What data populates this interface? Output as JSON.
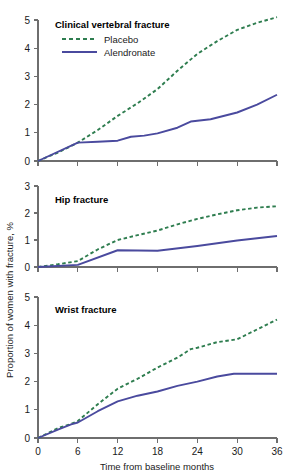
{
  "figure": {
    "y_axis_title": "Proportion of women with fracture, %",
    "x_axis_title": "Time from baseline months",
    "legend": {
      "placebo_label": "Placebo",
      "alendronate_label": "Alendronate",
      "placebo_color": "#2e7d4f",
      "alendronate_color": "#4a4a9e",
      "placebo_style": "dashed",
      "alendronate_style": "solid"
    }
  },
  "chart_data": [
    {
      "type": "line",
      "title": "Clinical vertebral fracture",
      "xlabel": "Time from baseline months",
      "ylabel": "Proportion of women with fracture, %",
      "x": [
        0,
        6,
        12,
        18,
        24,
        30,
        36
      ],
      "xlim": [
        0,
        36
      ],
      "ylim": [
        0,
        5
      ],
      "yticks": [
        0,
        1,
        2,
        3,
        4,
        5
      ],
      "xticks": [
        0,
        6,
        12,
        18,
        24,
        30,
        36
      ],
      "grid": false,
      "legend_position": "top-left",
      "series": [
        {
          "name": "Placebo",
          "color": "#2e7d4f",
          "style": "dashed",
          "values": [
            0.0,
            0.65,
            1.6,
            2.55,
            3.8,
            4.65,
            5.1
          ],
          "points": [
            {
              "x": 0,
              "y": 0.0
            },
            {
              "x": 3,
              "y": 0.3
            },
            {
              "x": 6,
              "y": 0.65
            },
            {
              "x": 9,
              "y": 1.1
            },
            {
              "x": 12,
              "y": 1.6
            },
            {
              "x": 15,
              "y": 2.05
            },
            {
              "x": 18,
              "y": 2.55
            },
            {
              "x": 21,
              "y": 3.2
            },
            {
              "x": 24,
              "y": 3.8
            },
            {
              "x": 27,
              "y": 4.25
            },
            {
              "x": 30,
              "y": 4.65
            },
            {
              "x": 33,
              "y": 4.9
            },
            {
              "x": 36,
              "y": 5.1
            }
          ]
        },
        {
          "name": "Alendronate",
          "color": "#4a4a9e",
          "style": "solid",
          "values": [
            0.0,
            0.65,
            0.72,
            0.98,
            1.4,
            1.72,
            2.35
          ],
          "points": [
            {
              "x": 0,
              "y": 0.0
            },
            {
              "x": 6,
              "y": 0.65
            },
            {
              "x": 9,
              "y": 0.68
            },
            {
              "x": 12,
              "y": 0.72
            },
            {
              "x": 14,
              "y": 0.86
            },
            {
              "x": 16,
              "y": 0.9
            },
            {
              "x": 18,
              "y": 0.98
            },
            {
              "x": 21,
              "y": 1.18
            },
            {
              "x": 23,
              "y": 1.4
            },
            {
              "x": 26,
              "y": 1.48
            },
            {
              "x": 30,
              "y": 1.72
            },
            {
              "x": 33,
              "y": 2.0
            },
            {
              "x": 36,
              "y": 2.35
            }
          ]
        }
      ]
    },
    {
      "type": "line",
      "title": "Hip fracture",
      "xlabel": "Time from baseline months",
      "ylabel": "Proportion of women with fracture, %",
      "x": [
        0,
        6,
        12,
        18,
        24,
        30,
        36
      ],
      "xlim": [
        0,
        36
      ],
      "ylim": [
        0,
        3
      ],
      "yticks": [
        0,
        1,
        2,
        3
      ],
      "xticks": [
        0,
        6,
        12,
        18,
        24,
        30,
        36
      ],
      "grid": false,
      "legend_position": "none",
      "series": [
        {
          "name": "Placebo",
          "color": "#2e7d4f",
          "style": "dashed",
          "values": [
            0.0,
            0.22,
            1.0,
            1.35,
            1.78,
            2.1,
            2.25
          ],
          "points": [
            {
              "x": 0,
              "y": 0.0
            },
            {
              "x": 3,
              "y": 0.1
            },
            {
              "x": 6,
              "y": 0.22
            },
            {
              "x": 9,
              "y": 0.65
            },
            {
              "x": 12,
              "y": 1.0
            },
            {
              "x": 15,
              "y": 1.18
            },
            {
              "x": 18,
              "y": 1.35
            },
            {
              "x": 21,
              "y": 1.58
            },
            {
              "x": 24,
              "y": 1.78
            },
            {
              "x": 27,
              "y": 1.95
            },
            {
              "x": 30,
              "y": 2.1
            },
            {
              "x": 33,
              "y": 2.2
            },
            {
              "x": 36,
              "y": 2.25
            }
          ]
        },
        {
          "name": "Alendronate",
          "color": "#4a4a9e",
          "style": "solid",
          "values": [
            0.0,
            0.08,
            0.62,
            0.6,
            0.78,
            0.98,
            1.15
          ],
          "points": [
            {
              "x": 0,
              "y": 0.0
            },
            {
              "x": 6,
              "y": 0.08
            },
            {
              "x": 12,
              "y": 0.62
            },
            {
              "x": 18,
              "y": 0.6
            },
            {
              "x": 24,
              "y": 0.78
            },
            {
              "x": 30,
              "y": 0.98
            },
            {
              "x": 36,
              "y": 1.15
            }
          ]
        }
      ]
    },
    {
      "type": "line",
      "title": "Wrist fracture",
      "xlabel": "Time from baseline months",
      "ylabel": "Proportion of women with fracture, %",
      "x": [
        0,
        6,
        12,
        18,
        24,
        30,
        36
      ],
      "xlim": [
        0,
        36
      ],
      "ylim": [
        0,
        5
      ],
      "yticks": [
        0,
        1,
        2,
        3,
        4,
        5
      ],
      "xticks": [
        0,
        6,
        12,
        18,
        24,
        30,
        36
      ],
      "grid": false,
      "legend_position": "none",
      "series": [
        {
          "name": "Placebo",
          "color": "#2e7d4f",
          "style": "dashed",
          "values": [
            0.0,
            0.6,
            1.75,
            2.5,
            3.2,
            3.5,
            4.2
          ],
          "points": [
            {
              "x": 0,
              "y": 0.0
            },
            {
              "x": 3,
              "y": 0.35
            },
            {
              "x": 5,
              "y": 0.5
            },
            {
              "x": 6,
              "y": 0.6
            },
            {
              "x": 9,
              "y": 1.2
            },
            {
              "x": 12,
              "y": 1.75
            },
            {
              "x": 15,
              "y": 2.1
            },
            {
              "x": 18,
              "y": 2.5
            },
            {
              "x": 21,
              "y": 2.85
            },
            {
              "x": 23,
              "y": 3.15
            },
            {
              "x": 24,
              "y": 3.2
            },
            {
              "x": 27,
              "y": 3.4
            },
            {
              "x": 30,
              "y": 3.5
            },
            {
              "x": 33,
              "y": 3.85
            },
            {
              "x": 36,
              "y": 4.2
            }
          ]
        },
        {
          "name": "Alendronate",
          "color": "#4a4a9e",
          "style": "solid",
          "values": [
            0.0,
            0.55,
            1.3,
            1.65,
            2.0,
            2.28,
            2.28
          ],
          "points": [
            {
              "x": 0,
              "y": 0.0
            },
            {
              "x": 3,
              "y": 0.3
            },
            {
              "x": 5,
              "y": 0.48
            },
            {
              "x": 6,
              "y": 0.55
            },
            {
              "x": 9,
              "y": 0.95
            },
            {
              "x": 12,
              "y": 1.3
            },
            {
              "x": 15,
              "y": 1.5
            },
            {
              "x": 18,
              "y": 1.65
            },
            {
              "x": 21,
              "y": 1.85
            },
            {
              "x": 24,
              "y": 2.0
            },
            {
              "x": 27,
              "y": 2.18
            },
            {
              "x": 29.5,
              "y": 2.28
            },
            {
              "x": 33,
              "y": 2.28
            },
            {
              "x": 36,
              "y": 2.28
            }
          ]
        }
      ]
    }
  ]
}
